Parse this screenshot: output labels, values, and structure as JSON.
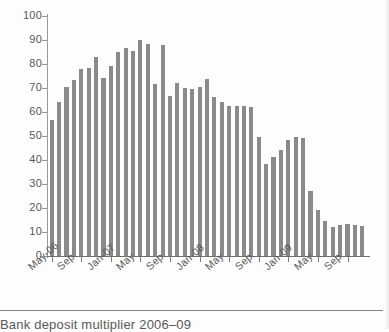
{
  "caption": {
    "text": "Bank deposit multiplier 2006–09"
  },
  "chart_data": {
    "type": "bar",
    "title": "Bank deposit multiplier 2006–09",
    "xlabel": "",
    "ylabel": "",
    "ylim": [
      0,
      100
    ],
    "ytick_labels": [
      "100",
      "90",
      "80",
      "70",
      "60",
      "50",
      "40",
      "30",
      "20",
      "10",
      "0"
    ],
    "ytick_values": [
      100,
      90,
      80,
      70,
      60,
      50,
      40,
      30,
      20,
      10,
      0
    ],
    "grid": false,
    "legend": "none",
    "bar_color": "#8a8a8a",
    "axis_color": "#7b7b7b",
    "text_color": "#585858",
    "categories": [
      "May-06",
      "Jun-06",
      "Jul-06",
      "Aug-06",
      "Sep-06",
      "Oct-06",
      "Nov-06",
      "Dec-06",
      "Jan-07",
      "Feb-07",
      "Mar-07",
      "Apr-07",
      "May-07",
      "Jun-07",
      "Jul-07",
      "Aug-07",
      "Sep-07",
      "Oct-07",
      "Nov-07",
      "Dec-07",
      "Jan-08",
      "Feb-08",
      "Mar-08",
      "Apr-08",
      "May-08",
      "Jun-08",
      "Jul-08",
      "Aug-08",
      "Sep-08",
      "Oct-08",
      "Nov-08",
      "Dec-08",
      "Jan-09",
      "Feb-09",
      "Mar-09",
      "Apr-09",
      "May-09",
      "Jun-09",
      "Jul-09",
      "Aug-09",
      "Sep-09",
      "Oct-09",
      "Nov-09"
    ],
    "values": [
      56.5,
      64.0,
      70.5,
      73.5,
      78.0,
      78.5,
      83.0,
      74.0,
      79.0,
      85.0,
      86.8,
      85.5,
      90.0,
      88.5,
      71.5,
      88.0,
      66.5,
      72.0,
      70.0,
      69.5,
      70.5,
      73.8,
      66.3,
      64.0,
      62.7,
      62.5,
      62.6,
      62.2,
      49.7,
      38.2,
      41.2,
      44.0,
      48.4,
      49.5,
      49.0,
      27.0,
      19.0,
      14.5,
      12.2,
      12.8,
      13.2,
      13.1,
      12.6
    ],
    "xtick_labels": [
      "May-06",
      "Sep",
      "Jan-07",
      "May",
      "Sep",
      "Jan-08",
      "May",
      "Sep",
      "Jan-09",
      "May",
      "Sep"
    ],
    "xtick_indices": [
      0,
      4,
      8,
      12,
      16,
      20,
      24,
      28,
      32,
      36,
      40
    ]
  }
}
